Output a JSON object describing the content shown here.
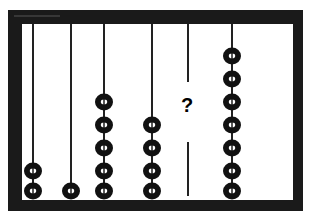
{
  "diagram": {
    "title": "",
    "type": "abacus",
    "rods": [
      {
        "label": "rod-1",
        "beads": 2
      },
      {
        "label": "rod-2",
        "beads": 1
      },
      {
        "label": "rod-3",
        "beads": 5
      },
      {
        "label": "rod-4",
        "beads": 4
      },
      {
        "label": "rod-5",
        "beads": null,
        "unknown_text": "?"
      },
      {
        "label": "rod-6",
        "beads": 7
      }
    ],
    "colors": {
      "frame": "#1a1a1a",
      "bead": "#111111",
      "rod": "#222222",
      "background": "#ffffff"
    }
  }
}
